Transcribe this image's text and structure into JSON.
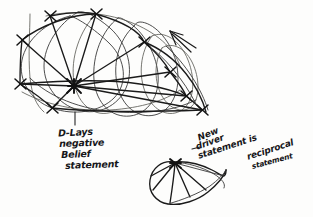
{
  "document": {
    "kind": "hand-drawn-sketch",
    "medium": "pen on paper scan",
    "background_color": "#fdfdfc",
    "ink_color": "#1b1b1b"
  },
  "annotations": {
    "belief_label": {
      "lines": [
        "D-Lays",
        "negative",
        "Belief",
        "statement"
      ],
      "pointer": "vertical tick pointing up to hub node"
    },
    "reciprocal_label": {
      "lines": [
        "New",
        "driver",
        "statement is"
      ],
      "leader": "dash leader pointing left to fan figure"
    },
    "reciprocal_label_2": {
      "lines": [
        "reciprocal",
        "statement"
      ]
    }
  },
  "figures": {
    "main_graph": {
      "name": "tangled node-edge network",
      "node_count": 10,
      "hub_node": "central high-degree node",
      "arrow": "arrowhead pointing up-left"
    },
    "fan_figure": {
      "name": "fan / shell figure",
      "hub_node": "apex node with radiating arcs",
      "ray_count": 6
    }
  },
  "colors": {
    "ink": "#1b1b1b",
    "light_ink": "#3a3a3a",
    "paper": "#fdfdfc"
  }
}
